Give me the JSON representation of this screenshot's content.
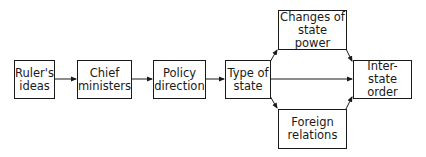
{
  "diagram": {
    "type": "flowchart",
    "nodes": [
      {
        "id": "rulers_ideas",
        "label": "Ruler's\nideas"
      },
      {
        "id": "chief_ministers",
        "label": "Chief\nministers"
      },
      {
        "id": "policy_direction",
        "label": "Policy\ndirection"
      },
      {
        "id": "type_of_state",
        "label": "Type of\nstate"
      },
      {
        "id": "changes_of_state_power",
        "label": "Changes of\nstate power"
      },
      {
        "id": "foreign_relations",
        "label": "Foreign\nrelations"
      },
      {
        "id": "inter_state_order",
        "label": "Inter-state\norder"
      }
    ],
    "edges": [
      {
        "from": "rulers_ideas",
        "to": "chief_ministers"
      },
      {
        "from": "chief_ministers",
        "to": "policy_direction"
      },
      {
        "from": "policy_direction",
        "to": "type_of_state"
      },
      {
        "from": "type_of_state",
        "to": "changes_of_state_power"
      },
      {
        "from": "type_of_state",
        "to": "inter_state_order"
      },
      {
        "from": "type_of_state",
        "to": "foreign_relations"
      },
      {
        "from": "changes_of_state_power",
        "to": "inter_state_order"
      },
      {
        "from": "foreign_relations",
        "to": "inter_state_order"
      }
    ],
    "colors": {
      "stroke": "#1a1a1a",
      "background": "#ffffff"
    }
  }
}
